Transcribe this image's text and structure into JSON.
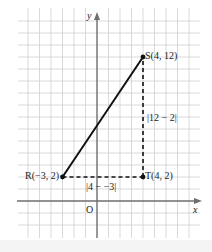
{
  "diagram": {
    "type": "coordinate-plane",
    "axes": {
      "x_label": "x",
      "y_label": "y",
      "origin_label": "O"
    },
    "points": [
      {
        "name": "S",
        "label": "S(4, 12)",
        "x": 4,
        "y": 12
      },
      {
        "name": "R",
        "label": "R(−3, 2)",
        "x": -3,
        "y": 2
      },
      {
        "name": "T",
        "label": "T(4, 2)",
        "x": 4,
        "y": 2
      }
    ],
    "segments": [
      {
        "from": "R",
        "to": "S",
        "style": "solid"
      },
      {
        "from": "R",
        "to": "T",
        "style": "dashed",
        "label": "|4 − −3|"
      },
      {
        "from": "T",
        "to": "S",
        "style": "dashed",
        "label": "|12 − 2|"
      }
    ],
    "colors": {
      "grid": "#c8c8c8",
      "axis": "#6e6e6e",
      "line": "#111111"
    }
  },
  "labels": {
    "y_axis": "y",
    "x_axis": "x",
    "origin": "O",
    "S": "S(4, 12)",
    "R": "R(−3, 2)",
    "T": "T(4, 2)",
    "horizontal_distance": "|4 − −3|",
    "vertical_distance": "|12 − 2|"
  }
}
